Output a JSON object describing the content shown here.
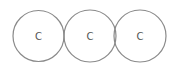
{
  "diagram": {
    "atoms": [
      {
        "label": "C",
        "cx": 38.5,
        "cy": 36,
        "r": 25.5
      },
      {
        "label": "C",
        "cx": 90,
        "cy": 36,
        "r": 26
      },
      {
        "label": "C",
        "cx": 140,
        "cy": 36,
        "r": 26
      }
    ],
    "colors": {
      "stroke": "#8a8a8a",
      "text": "#555555",
      "background": "#ffffff"
    }
  }
}
